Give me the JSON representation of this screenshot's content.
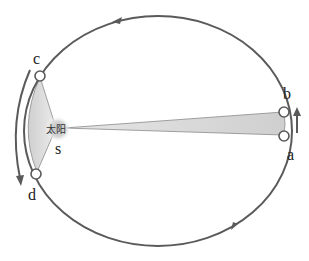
{
  "diagram": {
    "sun": {
      "label": "太阳",
      "point_label": "s"
    },
    "points": {
      "a": "a",
      "b": "b",
      "c": "c",
      "d": "d"
    },
    "colors": {
      "orbit": "#5a5a5a",
      "sector_fill": "#d9d9d9",
      "sun_glow": "#c8c8c8",
      "text": "#222222"
    },
    "orbit": {
      "cx": 158,
      "cy": 131,
      "rx": 134,
      "ry": 115,
      "direction": "counter-clockwise"
    }
  }
}
